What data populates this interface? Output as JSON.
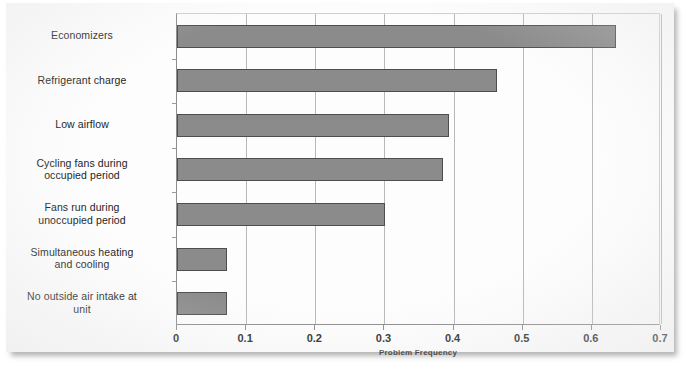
{
  "chart_data": {
    "type": "bar",
    "orientation": "horizontal",
    "title": "",
    "xlabel": "Problem Frequency",
    "ylabel": "",
    "xlim": [
      0,
      0.7
    ],
    "xticks": [
      "0",
      "0.1",
      "0.2",
      "0.3",
      "0.4",
      "0.5",
      "0.6",
      "0.7"
    ],
    "xtick_values": [
      0,
      0.1,
      0.2,
      0.3,
      0.4,
      0.5,
      0.6,
      0.7
    ],
    "grid": "vertical",
    "legend": null,
    "categories": [
      "Economizers",
      "Refrigerant charge",
      "Low airflow",
      "Cycling fans during occupied period",
      "Fans run during unoccupied period",
      "Simultaneous heating and cooling",
      "No outside air intake at unit"
    ],
    "category_lines": [
      [
        "Economizers"
      ],
      [
        "Refrigerant charge"
      ],
      [
        "Low airflow"
      ],
      [
        "Cycling fans during",
        "occupied period"
      ],
      [
        "Fans run during",
        "unoccupied period"
      ],
      [
        "Simultaneous heating",
        "and cooling"
      ],
      [
        "No outside air intake at",
        "unit"
      ]
    ],
    "values": [
      0.635,
      0.463,
      0.394,
      0.384,
      0.301,
      0.072,
      0.072
    ],
    "bar_color": "#8b8b8b",
    "bar_border_color": "#4e4e4e",
    "gridline_color": "#b9b9b9",
    "axis_color": "#8d8d8d",
    "background_color": "#fdfdfd"
  }
}
